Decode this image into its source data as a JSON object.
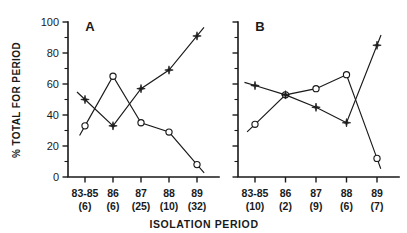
{
  "figure": {
    "xlabel": "ISOLATION PERIOD",
    "ylabel": "% TOTAL FOR PERIOD",
    "panel_a_letter": "A",
    "panel_b_letter": "B"
  },
  "chart_data": {
    "type": "line",
    "title": "",
    "xlabel": "ISOLATION PERIOD",
    "ylabel": "% TOTAL FOR PERIOD",
    "ylim": [
      0,
      100
    ],
    "yticks": [
      0,
      20,
      40,
      60,
      80,
      100
    ],
    "ytick_labels": [
      "0",
      "20",
      "40",
      "60",
      "80",
      "100"
    ],
    "yminor_ticks": [
      10,
      30,
      50,
      70,
      90
    ],
    "grid": false,
    "legend": "none",
    "panels": [
      {
        "label": "A",
        "categories": [
          "83-85",
          "86",
          "87",
          "88",
          "89"
        ],
        "counts": [
          "(6)",
          "(6)",
          "(25)",
          "(10)",
          "(32)"
        ],
        "series": [
          {
            "name": "open-circle-series",
            "marker": "open-circle",
            "values": [
              33,
              65,
              35,
              29,
              8
            ]
          },
          {
            "name": "filled-star-series",
            "marker": "filled-star",
            "values": [
              50,
              33,
              57,
              69,
              91
            ]
          }
        ]
      },
      {
        "label": "B",
        "categories": [
          "83-85",
          "86",
          "87",
          "88",
          "89"
        ],
        "counts": [
          "(10)",
          "(2)",
          "(9)",
          "(6)",
          "(7)"
        ],
        "series": [
          {
            "name": "open-circle-series",
            "marker": "open-circle",
            "values": [
              34,
              53,
              57,
              66,
              12
            ]
          },
          {
            "name": "filled-star-series",
            "marker": "filled-star",
            "values": [
              59,
              53,
              45,
              35,
              85
            ]
          }
        ]
      }
    ]
  }
}
